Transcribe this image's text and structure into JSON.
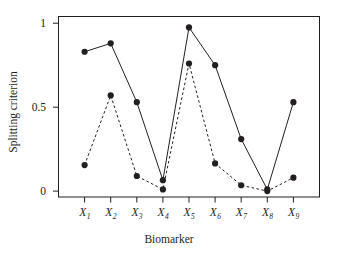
{
  "chart_data": {
    "type": "line",
    "title": "",
    "xlabel": "Biomarker",
    "ylabel": "Splitting criterion",
    "categories": [
      "X1",
      "X2",
      "X3",
      "X4",
      "X5",
      "X6",
      "X7",
      "X8",
      "X9"
    ],
    "category_labels": [
      {
        "base": "X",
        "sub": "1"
      },
      {
        "base": "X",
        "sub": "2"
      },
      {
        "base": "X",
        "sub": "3"
      },
      {
        "base": "X",
        "sub": "4"
      },
      {
        "base": "X",
        "sub": "5"
      },
      {
        "base": "X",
        "sub": "6"
      },
      {
        "base": "X",
        "sub": "7"
      },
      {
        "base": "X",
        "sub": "8"
      },
      {
        "base": "X",
        "sub": "9"
      }
    ],
    "series": [
      {
        "name": "solid-series",
        "line_style": "solid",
        "marker": "filled-circle",
        "color": "#231f20",
        "values": [
          0.83,
          0.88,
          0.53,
          0.065,
          0.975,
          0.75,
          0.31,
          0.01,
          0.53
        ]
      },
      {
        "name": "dashed-series",
        "line_style": "dashed",
        "marker": "filled-circle",
        "color": "#231f20",
        "values": [
          0.155,
          0.57,
          0.09,
          0.01,
          0.76,
          0.165,
          0.035,
          0.0,
          0.08
        ]
      }
    ],
    "ylim": [
      -0.035,
      1.04
    ],
    "yticks": [
      0,
      0.5,
      1
    ],
    "ytick_labels": [
      "0",
      "0.5",
      "1"
    ],
    "grid": false,
    "legend": "none",
    "frame": "box",
    "annotations": []
  },
  "axes": {
    "x_title": "Biomarker",
    "y_title": "Splitting criterion"
  }
}
